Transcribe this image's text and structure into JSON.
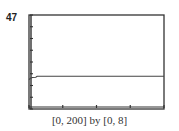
{
  "figure_label": "47",
  "chart_data": {
    "type": "line",
    "title": "",
    "xlabel": "",
    "ylabel": "",
    "xlim": [
      0,
      200
    ],
    "ylim": [
      0,
      8
    ],
    "x_ticks": [
      0,
      50,
      100,
      150,
      200
    ],
    "y_ticks": [
      0,
      1,
      2,
      3,
      4,
      5,
      6,
      7,
      8
    ],
    "grid": false,
    "caption": "[0, 200] by [0, 8]",
    "series": [
      {
        "name": "curve",
        "x": [
          0,
          2,
          5,
          10,
          12,
          50,
          100,
          150,
          200
        ],
        "y": [
          2.5,
          2.62,
          2.68,
          2.7,
          2.78,
          2.78,
          2.78,
          2.78,
          2.78
        ]
      }
    ],
    "colors": {
      "frame": "#333333",
      "line": "#444444"
    }
  }
}
